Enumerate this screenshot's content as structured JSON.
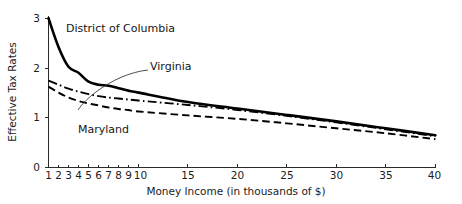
{
  "chart_data": {
    "type": "line",
    "title": "",
    "xlabel": "Money Income (in thousands of $)",
    "ylabel": "Effective Tax Rates",
    "xlim": [
      1,
      40
    ],
    "ylim": [
      0,
      3
    ],
    "grid": false,
    "legend_position": "inline-labels",
    "xticks": [
      1,
      2,
      3,
      4,
      5,
      6,
      7,
      8,
      9,
      10,
      15,
      20,
      25,
      30,
      35,
      40
    ],
    "xticklabels": [
      "1",
      "2",
      "3",
      "4",
      "5",
      "6",
      "7",
      "8",
      "9",
      "10",
      "15",
      "20",
      "25",
      "30",
      "35",
      "40"
    ],
    "yticks": [
      0,
      1,
      2,
      3
    ],
    "yticklabels": [
      "0",
      "1",
      "2",
      "3"
    ],
    "x": [
      1,
      2,
      3,
      4,
      5,
      6,
      7,
      8,
      9,
      10,
      15,
      20,
      25,
      30,
      35,
      40
    ],
    "series": [
      {
        "name": "District of Columbia",
        "style": "solid",
        "label_x": 6.0,
        "label_y": 2.55,
        "values": [
          3.0,
          2.42,
          2.02,
          1.9,
          1.72,
          1.66,
          1.64,
          1.59,
          1.54,
          1.5,
          1.31,
          1.18,
          1.05,
          0.92,
          0.78,
          0.64
        ]
      },
      {
        "name": "Virginia",
        "style": "dash-dot",
        "label_x": 13.2,
        "label_y": 2.02,
        "values": [
          1.74,
          1.66,
          1.58,
          1.52,
          1.47,
          1.43,
          1.4,
          1.38,
          1.36,
          1.34,
          1.25,
          1.15,
          1.03,
          0.9,
          0.76,
          0.62
        ]
      },
      {
        "name": "Maryland",
        "style": "dashed",
        "label_x": 5.6,
        "label_y": 0.86,
        "values": [
          1.62,
          1.5,
          1.4,
          1.33,
          1.28,
          1.24,
          1.2,
          1.17,
          1.15,
          1.12,
          1.04,
          0.97,
          0.88,
          0.78,
          0.68,
          0.56
        ]
      }
    ],
    "annotations": [
      {
        "text": "District of Columbia",
        "kind": "series-label",
        "for": "District of Columbia"
      },
      {
        "text": "Virginia",
        "kind": "series-label",
        "for": "Virginia"
      },
      {
        "text": "Maryland",
        "kind": "series-label",
        "for": "Maryland"
      }
    ],
    "colors": {
      "line": "#000000",
      "axis": "#2b2b2b",
      "text": "#1c1c1c",
      "background": "#ffffff"
    }
  }
}
